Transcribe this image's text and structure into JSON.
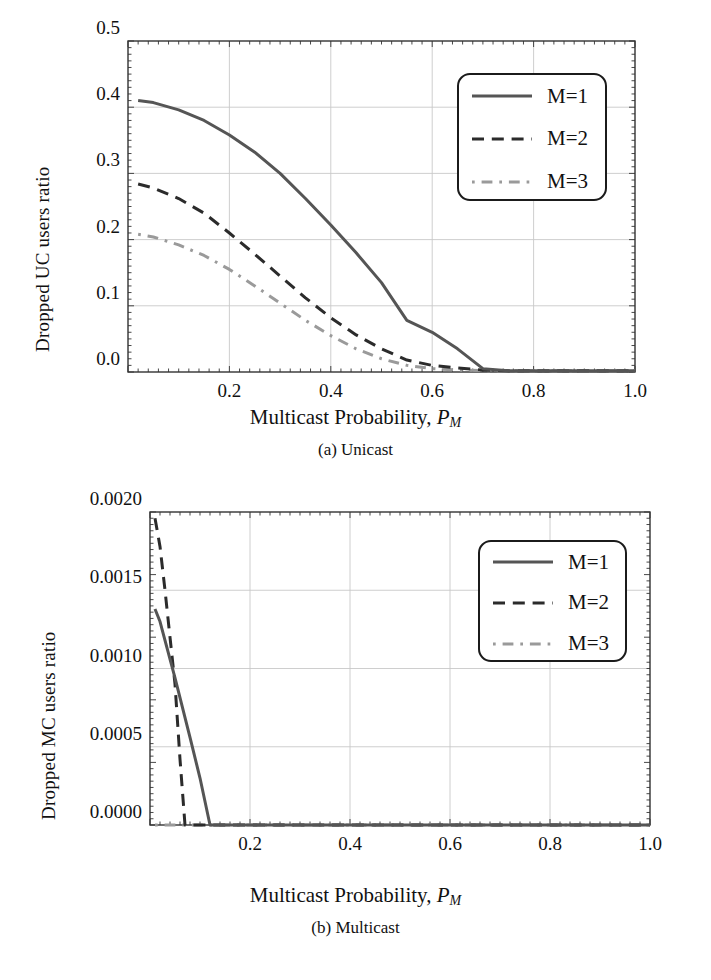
{
  "figure": {
    "panels": [
      {
        "id": "unicast",
        "caption": "(a) Unicast",
        "xlabel_main": "Multicast Probability, ",
        "xlabel_sym": "P",
        "xlabel_sub": "M",
        "ylabel": "Dropped UC users ratio",
        "ytick_labels": [
          "0.5",
          "0.4",
          "0.3",
          "0.2",
          "0.1",
          "0.0"
        ],
        "xtick_labels": [
          "0.2",
          "0.4",
          "0.6",
          "0.8",
          "1.0"
        ],
        "legend": [
          "M=1",
          "M=2",
          "M=3"
        ]
      },
      {
        "id": "multicast",
        "caption": "(b) Multicast",
        "xlabel_main": "Multicast Probability, ",
        "xlabel_sym": "P",
        "xlabel_sub": "M",
        "ylabel": "Dropped MC users ratio",
        "ytick_labels": [
          "0.0020",
          "0.0015",
          "0.0010",
          "0.0005",
          "0.0000"
        ],
        "xtick_labels": [
          "0.2",
          "0.4",
          "0.6",
          "0.8",
          "1.0"
        ],
        "legend": [
          "M=1",
          "M=2",
          "M=3"
        ]
      }
    ]
  },
  "colors": {
    "series_m1": "#555555",
    "series_m2": "#2b2b2b",
    "series_m3": "#9a9a9a",
    "grid": "#c8c8c8",
    "axis": "#333333",
    "background": "#ffffff"
  },
  "chart_data": [
    {
      "type": "line",
      "title": "(a) Unicast",
      "xlabel": "Multicast Probability, P_M",
      "ylabel": "Dropped UC users ratio",
      "xlim": [
        0.0,
        1.0
      ],
      "ylim": [
        0.0,
        0.5
      ],
      "xticks": [
        0.2,
        0.4,
        0.6,
        0.8,
        1.0
      ],
      "yticks": [
        0.0,
        0.1,
        0.2,
        0.3,
        0.4,
        0.5
      ],
      "grid": true,
      "legend_position": "upper right",
      "series": [
        {
          "name": "M=1",
          "style": "solid",
          "color": "#555555",
          "x": [
            0.02,
            0.05,
            0.1,
            0.15,
            0.2,
            0.25,
            0.3,
            0.35,
            0.4,
            0.45,
            0.5,
            0.55,
            0.6,
            0.65,
            0.7,
            0.75,
            0.8,
            0.85,
            0.9,
            0.95,
            1.0
          ],
          "y": [
            0.41,
            0.407,
            0.396,
            0.38,
            0.358,
            0.332,
            0.3,
            0.262,
            0.222,
            0.18,
            0.135,
            0.078,
            0.06,
            0.035,
            0.005,
            0.002,
            0.002,
            0.002,
            0.002,
            0.002,
            0.002
          ]
        },
        {
          "name": "M=2",
          "style": "dashed",
          "color": "#2b2b2b",
          "x": [
            0.02,
            0.05,
            0.1,
            0.15,
            0.2,
            0.25,
            0.3,
            0.35,
            0.4,
            0.45,
            0.5,
            0.55,
            0.6,
            0.65,
            0.7,
            0.75,
            0.8,
            0.85,
            0.9,
            0.95,
            1.0
          ],
          "y": [
            0.284,
            0.278,
            0.262,
            0.24,
            0.21,
            0.178,
            0.145,
            0.112,
            0.082,
            0.056,
            0.035,
            0.018,
            0.01,
            0.006,
            0.003,
            0.002,
            0.002,
            0.002,
            0.002,
            0.002,
            0.002
          ]
        },
        {
          "name": "M=3",
          "style": "dashdot",
          "color": "#9a9a9a",
          "x": [
            0.02,
            0.05,
            0.1,
            0.15,
            0.2,
            0.25,
            0.3,
            0.35,
            0.4,
            0.45,
            0.5,
            0.55,
            0.6,
            0.65,
            0.7,
            0.75,
            0.8,
            0.85,
            0.9,
            0.95,
            1.0
          ],
          "y": [
            0.208,
            0.204,
            0.192,
            0.176,
            0.155,
            0.13,
            0.104,
            0.078,
            0.055,
            0.035,
            0.02,
            0.01,
            0.005,
            0.003,
            0.002,
            0.002,
            0.002,
            0.002,
            0.002,
            0.002,
            0.002
          ]
        }
      ]
    },
    {
      "type": "line",
      "title": "(b) Multicast",
      "xlabel": "Multicast Probability, P_M",
      "ylabel": "Dropped MC users ratio",
      "xlim": [
        0.0,
        1.0
      ],
      "ylim": [
        0.0,
        0.002
      ],
      "xticks": [
        0.2,
        0.4,
        0.6,
        0.8,
        1.0
      ],
      "yticks": [
        0.0,
        0.0005,
        0.001,
        0.0015,
        0.002
      ],
      "grid": true,
      "legend_position": "upper right",
      "series": [
        {
          "name": "M=1",
          "style": "solid",
          "color": "#555555",
          "x": [
            0.01,
            0.02,
            0.05,
            0.08,
            0.1,
            0.12,
            0.2,
            0.4,
            0.6,
            0.8,
            1.0
          ],
          "y": [
            0.00138,
            0.0013,
            0.00094,
            0.00056,
            0.0003,
            0.0,
            0.0,
            0.0,
            0.0,
            0.0,
            0.0
          ]
        },
        {
          "name": "M=2",
          "style": "dashed",
          "color": "#2b2b2b",
          "x": [
            0.01,
            0.02,
            0.03,
            0.05,
            0.06,
            0.07,
            0.2,
            0.4,
            0.6,
            0.8,
            1.0
          ],
          "y": [
            0.00196,
            0.00178,
            0.0015,
            0.0009,
            0.00042,
            0.0,
            0.0,
            0.0,
            0.0,
            0.0,
            0.0
          ]
        },
        {
          "name": "M=3",
          "style": "dashdot",
          "color": "#9a9a9a",
          "x": [
            0.01,
            0.1,
            0.2,
            0.4,
            0.6,
            0.8,
            1.0
          ],
          "y": [
            0.0,
            0.0,
            0.0,
            0.0,
            0.0,
            0.0,
            0.0
          ]
        }
      ]
    }
  ]
}
